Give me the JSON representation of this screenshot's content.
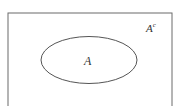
{
  "diagram": {
    "type": "venn",
    "universe": {
      "label": "A",
      "superscript": "c"
    },
    "set": {
      "label": "A"
    },
    "colors": {
      "stroke": "#6b6b6b",
      "background": "#ffffff",
      "text": "#333333"
    }
  }
}
